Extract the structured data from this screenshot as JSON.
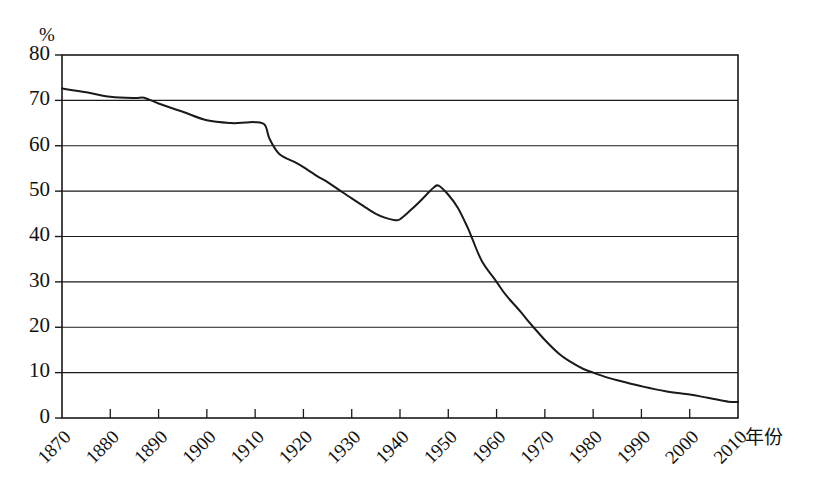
{
  "chart_data": {
    "type": "line",
    "title": "",
    "subtitle": "",
    "xlabel": "年份",
    "ylabel": "%",
    "unit_label": "%",
    "grid": true,
    "legend": false,
    "legend_position": "none",
    "xlim": [
      1870,
      2010
    ],
    "ylim": [
      0,
      80
    ],
    "x_tick_labels": [
      "1870",
      "1880",
      "1890",
      "1900",
      "1910",
      "1920",
      "1930",
      "1940",
      "1950",
      "1960",
      "1970",
      "1980",
      "1990",
      "2000",
      "2010"
    ],
    "x_ticks": [
      1870,
      1880,
      1890,
      1900,
      1910,
      1920,
      1930,
      1940,
      1950,
      1960,
      1970,
      1980,
      1990,
      2000,
      2010
    ],
    "y_tick_labels": [
      "0",
      "10",
      "20",
      "30",
      "40",
      "50",
      "60",
      "70",
      "80"
    ],
    "y_ticks": [
      0,
      10,
      20,
      30,
      40,
      50,
      60,
      70,
      80
    ],
    "series": [
      {
        "name": "",
        "color": "#1a1a1a",
        "x": [
          1870,
          1875,
          1880,
          1885,
          1887,
          1890,
          1895,
          1900,
          1905,
          1908,
          1910,
          1912,
          1913,
          1915,
          1918,
          1920,
          1923,
          1925,
          1928,
          1930,
          1933,
          1935,
          1937,
          1939,
          1940,
          1942,
          1944,
          1946,
          1947,
          1948,
          1950,
          1952,
          1954,
          1955,
          1957,
          1960,
          1962,
          1965,
          1967,
          1970,
          1973,
          1975,
          1978,
          1980,
          1983,
          1985,
          1990,
          1995,
          2000,
          2003,
          2005,
          2008,
          2010
        ],
        "values": [
          72.6,
          71.8,
          70.8,
          70.5,
          70.6,
          69.3,
          67.5,
          65.6,
          65.0,
          65.1,
          65.2,
          64.6,
          61.5,
          58.2,
          56.5,
          55.3,
          53.2,
          52.0,
          49.8,
          48.4,
          46.3,
          45.0,
          44.1,
          43.6,
          43.8,
          45.6,
          47.6,
          49.8,
          50.8,
          51.2,
          49.2,
          46.3,
          42.0,
          39.4,
          34.5,
          30.0,
          27.0,
          23.4,
          20.8,
          17.2,
          14.1,
          12.6,
          10.8,
          10.0,
          8.9,
          8.3,
          7.0,
          5.9,
          5.2,
          4.6,
          4.2,
          3.6,
          3.5
        ]
      }
    ],
    "annotations": []
  }
}
